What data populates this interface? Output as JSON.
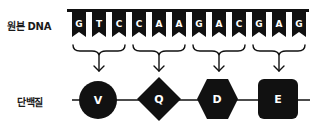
{
  "labels": {
    "template_dna": "원본 DNA",
    "protein": "단백질"
  },
  "dna": {
    "bases": [
      "G",
      "T",
      "C",
      "C",
      "A",
      "A",
      "G",
      "A",
      "C",
      "G",
      "A",
      "G"
    ],
    "codons": [
      {
        "bases": "GTC",
        "amino_acid": "V",
        "shape": "circle"
      },
      {
        "bases": "CAA",
        "amino_acid": "Q",
        "shape": "diamond"
      },
      {
        "bases": "GAC",
        "amino_acid": "D",
        "shape": "hexagon"
      },
      {
        "bases": "GAG",
        "amino_acid": "E",
        "shape": "rounded-square"
      }
    ]
  },
  "protein": {
    "amino_acids": [
      "V",
      "Q",
      "D",
      "E"
    ]
  },
  "colors": {
    "ink": "#111111",
    "background": "#ffffff",
    "text_on_ink": "#ffffff"
  }
}
